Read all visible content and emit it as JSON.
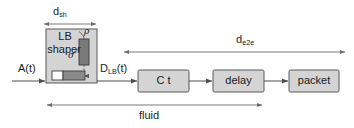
{
  "figure": {
    "type": "block-diagram",
    "background_color": "#ffffff",
    "line_color": "#4d4d4d",
    "box_fill": "#d4d4d4",
    "box_stroke": "#595959",
    "text_color": "#1c1c1c"
  },
  "inputs": {
    "arrival_label": "A(t)"
  },
  "shaper": {
    "title_line1": "LB",
    "title_line2": "shaper",
    "bucket_rate_label": "ρ",
    "bucket_depth_label": "σ",
    "queue_name": "packet-queue",
    "bucket_name": "token-bucket"
  },
  "signals": {
    "shaper_output_label": "D",
    "shaper_output_sub": "LB",
    "shaper_output_suffix": "(t)"
  },
  "blocks": [
    {
      "id": "ct",
      "label": "C t"
    },
    {
      "id": "delay",
      "label": "delay"
    },
    {
      "id": "packet",
      "label": "packet"
    }
  ],
  "measures": [
    {
      "id": "d-sh",
      "label": "d",
      "sub": "sh"
    },
    {
      "id": "d-e2e",
      "label": "d",
      "sub": "e2e"
    },
    {
      "id": "fluid",
      "label": "fluid",
      "sub": ""
    }
  ]
}
